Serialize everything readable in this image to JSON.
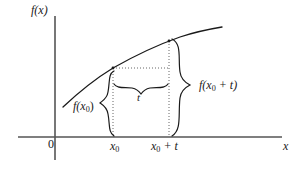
{
  "figure": {
    "kind": "calculus-difference-quotient-diagram",
    "background_color": "#ffffff",
    "ink_color": "#1a1a1a",
    "axis_color": "#555555",
    "curve_color": "#1a1a1a",
    "dotted_color": "#666666"
  },
  "axes": {
    "y_axis_label": "f(x)",
    "x_axis_label": "x",
    "origin_label": "0",
    "x_axis_y_px": 137,
    "y_axis_x_px": 55,
    "x_axis_from_px": 18,
    "x_axis_to_px": 282,
    "y_axis_from_px": 16,
    "y_axis_to_px": 160
  },
  "ticks": {
    "x": [
      {
        "label_main": "x",
        "label_sub": "0",
        "label_suffix": "",
        "x_px": 113
      },
      {
        "label_main": "x",
        "label_sub": "0",
        "label_suffix": " + t",
        "x_px": 169
      }
    ]
  },
  "curve": {
    "description": "increasing concave-down curve",
    "color": "#1a1a1a",
    "points_px": [
      [
        63,
        107
      ],
      [
        72,
        98
      ],
      [
        82,
        89
      ],
      [
        93,
        81
      ],
      [
        105,
        73
      ],
      [
        113,
        68
      ],
      [
        124,
        62
      ],
      [
        136,
        56
      ],
      [
        148,
        50
      ],
      [
        160,
        45
      ],
      [
        169,
        41
      ],
      [
        181,
        37
      ],
      [
        194,
        33
      ],
      [
        208,
        30
      ],
      [
        222,
        27
      ]
    ]
  },
  "guides": {
    "vertical_x0": {
      "x_px": 113,
      "from_y_px": 68,
      "to_y_px": 137
    },
    "vertical_x0t": {
      "x_px": 169,
      "from_y_px": 41,
      "to_y_px": 137
    },
    "horizontal_fx0": {
      "y_px": 68,
      "from_x_px": 113,
      "to_x_px": 169
    }
  },
  "annotations": {
    "left_brace": {
      "label_main": "f(x",
      "label_sub": "0",
      "label_suffix": ")",
      "full_text": "f(x0)",
      "meaning": "value of f at x0",
      "x_px": 111,
      "from_y_px": 71,
      "to_y_px": 136
    },
    "middle_brace": {
      "label": "t",
      "meaning": "horizontal increment t",
      "y_px": 86,
      "from_x_px": 114,
      "to_x_px": 168
    },
    "right_brace": {
      "label_main": "f(x",
      "label_sub": "0",
      "label_suffix": " + t)",
      "full_text": "f(x0 + t)",
      "meaning": "value of f at x0 + t",
      "x_px": 190,
      "from_y_px": 39,
      "to_y_px": 136
    }
  }
}
